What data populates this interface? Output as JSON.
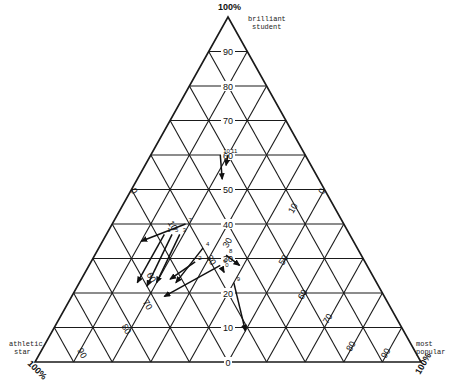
{
  "diagram": {
    "type": "ternary",
    "vertices": {
      "top": {
        "label_line1": "brilliant",
        "label_line2": "student",
        "pct": "100%"
      },
      "left": {
        "label_line1": "athletic",
        "label_line2": "star",
        "pct": "100%"
      },
      "right": {
        "label_line1": "most",
        "label_line2": "popular",
        "pct": "100%"
      }
    },
    "horizontal_ticks": [
      "0",
      "10",
      "20",
      "30",
      "40",
      "50",
      "60",
      "70",
      "80",
      "90"
    ],
    "left_diagonal_ticks": [
      "0",
      "10",
      "30",
      "60",
      "70",
      "80",
      "90"
    ],
    "right_diagonal_ticks": [
      "0",
      "10",
      "30",
      "50",
      "60",
      "70",
      "80",
      "90"
    ],
    "colors": {
      "line": "#1a1a1a",
      "background": "#ffffff"
    },
    "arrows": [
      {
        "id": "1",
        "label": "1",
        "from": [
          0.37,
          0.48,
          0.15
        ],
        "to": [
          0.23,
          0.62,
          0.15
        ]
      },
      {
        "id": "2",
        "label": "2",
        "from": [
          0.29,
          0.44,
          0.27
        ],
        "to": [
          0.24,
          0.53,
          0.23
        ]
      },
      {
        "id": "3",
        "label": "3",
        "from": [
          0.37,
          0.44,
          0.19
        ],
        "to": [
          0.23,
          0.57,
          0.2
        ]
      },
      {
        "id": "4",
        "label": "4",
        "from": [
          0.33,
          0.4,
          0.27
        ],
        "to": [
          0.23,
          0.52,
          0.25
        ]
      },
      {
        "id": "5",
        "label": "5",
        "from": [
          0.37,
          0.46,
          0.17
        ],
        "to": [
          0.22,
          0.6,
          0.18
        ]
      },
      {
        "id": "6",
        "label": "6",
        "from": [
          0.28,
          0.38,
          0.34
        ],
        "to": [
          0.19,
          0.57,
          0.24
        ]
      },
      {
        "id": "7",
        "label": "7",
        "from": [
          0.4,
          0.41,
          0.19
        ],
        "to": [
          0.35,
          0.55,
          0.1
        ]
      },
      {
        "id": "8",
        "label": "8",
        "from": [
          0.31,
          0.35,
          0.34
        ],
        "to": [
          0.28,
          0.33,
          0.39
        ]
      },
      {
        "id": "9",
        "label": "9",
        "from": [
          0.23,
          0.37,
          0.4
        ],
        "to": [
          0.09,
          0.41,
          0.5
        ]
      },
      {
        "id": "0",
        "label": "0",
        "from": [
          0.27,
          0.38,
          0.35
        ],
        "to": [
          0.26,
          0.38,
          0.36
        ]
      },
      {
        "id": "10",
        "label": "10",
        "from": [
          0.6,
          0.22,
          0.18
        ],
        "to": [
          0.53,
          0.25,
          0.22
        ]
      },
      {
        "id": "11",
        "label": "11",
        "from": [
          0.6,
          0.2,
          0.2
        ],
        "to": [
          0.57,
          0.22,
          0.21
        ]
      }
    ]
  }
}
